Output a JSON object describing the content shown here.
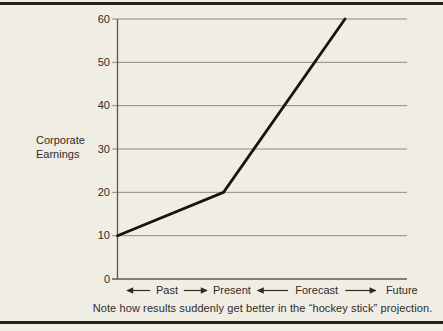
{
  "page": {
    "background_color": "#f0ede5"
  },
  "chart_data": {
    "type": "line",
    "title": "",
    "ylabel": "Corporate Earnings",
    "xlabel": "",
    "ylim": [
      0,
      60
    ],
    "yticks": [
      0,
      10,
      20,
      30,
      40,
      50,
      60
    ],
    "grid": "horizontal",
    "legend": "none",
    "series": [
      {
        "name": "Corporate Earnings",
        "points": [
          {
            "x": 0.0,
            "y": 10,
            "period": "Past"
          },
          {
            "x": 0.366,
            "y": 20,
            "period": "Present"
          },
          {
            "x": 0.786,
            "y": 60,
            "period": "Forecast"
          }
        ]
      }
    ],
    "x_axis_items": [
      {
        "kind": "span",
        "label": "Past",
        "from": 0.03,
        "to": 0.312
      },
      {
        "kind": "label",
        "label": "Present",
        "at": 0.395
      },
      {
        "kind": "span",
        "label": "Forecast",
        "from": 0.481,
        "to": 0.895
      },
      {
        "kind": "label",
        "label": "Future",
        "at": 0.982
      }
    ],
    "caption": "Note how results suddenly get better in the “hockey stick” projection.",
    "colors": {
      "background": "#f0ede5",
      "line": "#17140f",
      "grid": "#8d8a82",
      "axis": "#5c5850",
      "text": "#2f2c26",
      "rule": "#23201b"
    }
  }
}
